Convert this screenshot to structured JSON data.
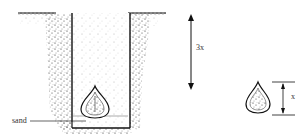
{
  "diagram": {
    "type": "planting-depth-illustration",
    "labels": {
      "depth": "3x",
      "bulb_height": "x",
      "sand": "sand"
    },
    "colors": {
      "ink": "#1a1a1a",
      "background": "#ffffff"
    }
  }
}
